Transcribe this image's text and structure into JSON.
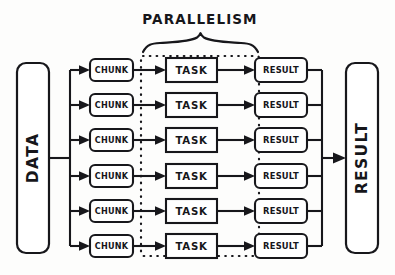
{
  "diagram": {
    "title": "PARALLELISM",
    "source_block": {
      "label": "DATA"
    },
    "sink_block": {
      "label": "RESULT"
    },
    "stage_labels": {
      "chunk": "CHUNK",
      "task": "TASK",
      "result": "RESULT"
    },
    "rows": [
      {
        "chunk": "CHUNK",
        "task": "TASK",
        "result": "RESULT"
      },
      {
        "chunk": "CHUNK",
        "task": "TASK",
        "result": "RESULT"
      },
      {
        "chunk": "CHUNK",
        "task": "TASK",
        "result": "RESULT"
      },
      {
        "chunk": "CHUNK",
        "task": "TASK",
        "result": "RESULT"
      },
      {
        "chunk": "CHUNK",
        "task": "TASK",
        "result": "RESULT"
      },
      {
        "chunk": "CHUNK",
        "task": "TASK",
        "result": "RESULT"
      }
    ],
    "row_count": 6,
    "colors": {
      "ink": "#17171b",
      "background": "#fdfdfc",
      "box_fill": "#ffffff"
    }
  }
}
